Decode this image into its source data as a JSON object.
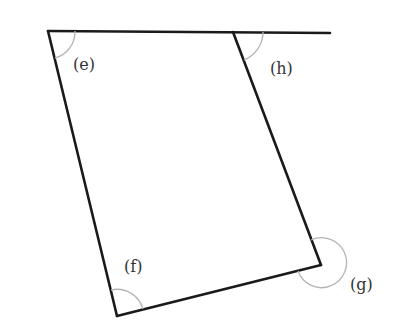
{
  "diagram": {
    "type": "quadrilateral-with-exterior-line",
    "colors": {
      "edge": "#1a1a1a",
      "arc": "#b5b5b5",
      "label": "#333333",
      "background": "#ffffff"
    },
    "vertices": {
      "top_left": [
        48,
        31
      ],
      "top_right": [
        233,
        32
      ],
      "bottom_right": [
        321,
        265
      ],
      "bottom_left": [
        117,
        316
      ]
    },
    "extended_line_end": [
      330,
      33
    ],
    "angles": [
      {
        "id": "e",
        "label": "(e)",
        "vertex": "top_left",
        "kind": "interior"
      },
      {
        "id": "h",
        "label": "(h)",
        "vertex": "top_right",
        "kind": "exterior"
      },
      {
        "id": "f",
        "label": "(f)",
        "vertex": "bottom_left",
        "kind": "interior"
      },
      {
        "id": "g",
        "label": "(g)",
        "vertex": "bottom_right",
        "kind": "reflex"
      }
    ]
  }
}
